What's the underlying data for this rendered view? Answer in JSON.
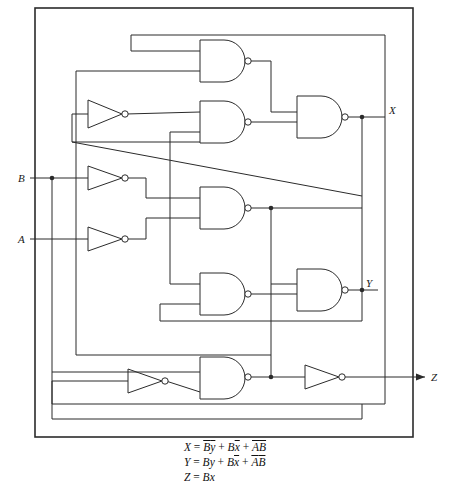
{
  "figure": {
    "type": "logic-circuit-schematic",
    "frame_color": "#2b2b2b",
    "background": "#ffffff"
  },
  "inputs": [
    {
      "id": "B",
      "label": "B",
      "x": 18,
      "y": 178
    },
    {
      "id": "A",
      "label": "A",
      "x": 18,
      "y": 239
    }
  ],
  "outputs": [
    {
      "id": "X",
      "label": "X",
      "x": 389,
      "y": 117,
      "arrow": false
    },
    {
      "id": "Y",
      "label": "Y",
      "x": 360,
      "y": 290,
      "arrow": false
    },
    {
      "id": "Z",
      "label": "Z",
      "x": 437,
      "y": 377,
      "arrow": true
    }
  ],
  "gates": [
    {
      "id": "nand1",
      "type": "nand",
      "inputs": 2,
      "x": 200,
      "y": 40,
      "w": 45,
      "h": 42
    },
    {
      "id": "nand2",
      "type": "nand",
      "inputs": 2,
      "x": 200,
      "y": 101,
      "w": 45,
      "h": 42
    },
    {
      "id": "nand3",
      "type": "nand",
      "inputs": 2,
      "x": 297,
      "y": 101,
      "w": 45,
      "h": 42
    },
    {
      "id": "nand4",
      "type": "nand",
      "inputs": 2,
      "x": 200,
      "y": 188,
      "w": 45,
      "h": 42
    },
    {
      "id": "nand5",
      "type": "nand",
      "inputs": 2,
      "x": 200,
      "y": 273,
      "w": 45,
      "h": 42
    },
    {
      "id": "nand6",
      "type": "nand",
      "inputs": 2,
      "x": 297,
      "y": 273,
      "w": 45,
      "h": 42
    },
    {
      "id": "nand7",
      "type": "nand",
      "inputs": 2,
      "x": 200,
      "y": 362,
      "w": 45,
      "h": 42
    },
    {
      "id": "inv1",
      "type": "inverter",
      "x": 88,
      "y": 100,
      "w": 34,
      "h": 28
    },
    {
      "id": "inv2",
      "type": "inverter",
      "x": 88,
      "y": 166,
      "w": 34,
      "h": 26
    },
    {
      "id": "inv3",
      "type": "inverter",
      "x": 88,
      "y": 227,
      "w": 34,
      "h": 26
    },
    {
      "id": "inv4",
      "type": "inverter",
      "x": 128,
      "y": 368,
      "w": 34,
      "h": 26
    },
    {
      "id": "inv5",
      "type": "inverter",
      "x": 305,
      "y": 365,
      "w": 34,
      "h": 26
    }
  ],
  "junctions": [
    {
      "id": "j-B-tap",
      "x": 52,
      "y": 178
    },
    {
      "id": "j-X-out",
      "x": 362,
      "y": 117
    },
    {
      "id": "j-nand4-out",
      "x": 271,
      "y": 208
    },
    {
      "id": "j-Y-out",
      "x": 362,
      "y": 290
    },
    {
      "id": "j-Z-in",
      "x": 271,
      "y": 377
    }
  ],
  "equations": {
    "lines": [
      {
        "id": "eq-X",
        "html": "X = B̄ȳ + Bx̄ + ĀB̄"
      },
      {
        "id": "eq-Y",
        "html": "Y = By + Bx̄ + ĀB̄"
      },
      {
        "id": "eq-Z",
        "html": "Z = Bx"
      }
    ],
    "eq_x_lhs": "X",
    "eq_y_lhs": "Y",
    "eq_z_lhs": "Z",
    "eq_eq": "=",
    "eq_plus": "+",
    "term_x_1_a": "B",
    "term_x_1_b": "y",
    "term_x_2_a": "B",
    "term_x_2_b": "x",
    "term_x_3_a": "A",
    "term_x_3_b": "B",
    "term_y_1_a": "B",
    "term_y_1_b": "y",
    "term_y_2_a": "B",
    "term_y_2_b": "x",
    "term_y_3_a": "A",
    "term_y_3_b": "B",
    "term_z_1_a": "B",
    "term_z_1_b": "x"
  }
}
